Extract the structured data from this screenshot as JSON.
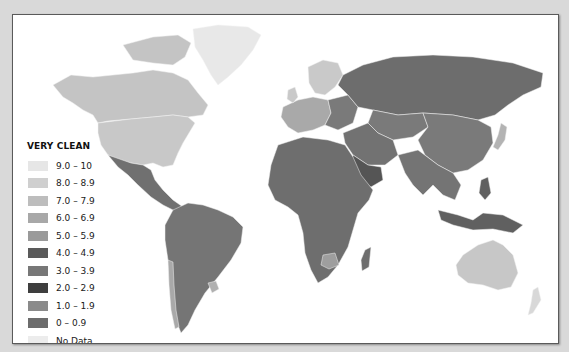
{
  "map": {
    "type": "choropleth",
    "subject": "Corruption perception index by country",
    "background": "#ffffff",
    "ocean_color": "#ffffff"
  },
  "legend": {
    "top_label": "VERY CLEAN",
    "bottom_label": "HIGHLY CORRUPT",
    "items": [
      {
        "label": "9.0 – 10",
        "color": "#e6e6e6"
      },
      {
        "label": "8.0 – 8.9",
        "color": "#cfcfcf"
      },
      {
        "label": "7.0 – 7.9",
        "color": "#bdbdbd"
      },
      {
        "label": "6.0 – 6.9",
        "color": "#a8a8a8"
      },
      {
        "label": "5.0 – 5.9",
        "color": "#9a9a9a"
      },
      {
        "label": "4.0 – 4.9",
        "color": "#5a5a5a"
      },
      {
        "label": "3.0 – 3.9",
        "color": "#777777"
      },
      {
        "label": "2.0 – 2.9",
        "color": "#3e3e3e"
      },
      {
        "label": "1.0 – 1.9",
        "color": "#8a8a8a"
      },
      {
        "label": "0 – 0.9",
        "color": "#6c6c6c"
      },
      {
        "label": "No Data",
        "color": "#ececec"
      }
    ]
  },
  "regions": {
    "greenland": "#e8e8e8",
    "canada": "#c4c4c4",
    "usa": "#c8c8c8",
    "mexico_central_america": "#707070",
    "south_america": "#757575",
    "chile": "#a9a9a9",
    "uruguay": "#b0b0b0",
    "europe_north": "#c9c9c9",
    "europe_west": "#a9a9a9",
    "europe_east": "#7a7a7a",
    "russia": "#6d6d6d",
    "china": "#7a7a7a",
    "middle_east": "#727272",
    "saudi": "#555555",
    "africa": "#6e6e6e",
    "botswana": "#9e9e9e",
    "india_se_asia": "#747474",
    "indonesia_png": "#606060",
    "japan": "#b3b3b3",
    "australia": "#c7c7c7",
    "new_zealand": "#d8d8d8"
  }
}
